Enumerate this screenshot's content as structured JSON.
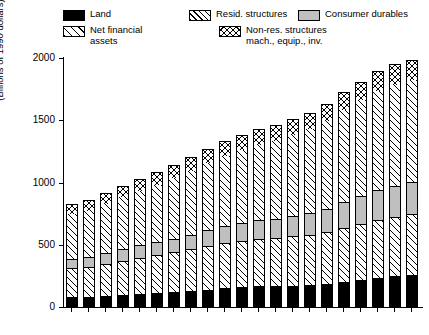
{
  "legend": {
    "items": [
      {
        "label": "Land",
        "swatch": "solid-black-swatch",
        "key": "land"
      },
      {
        "label": "Resid. structures",
        "swatch": "diagonal-hatch-swatch",
        "key": "resid"
      },
      {
        "label": "Consumer durables",
        "swatch": "solid-gray-swatch",
        "key": "durables"
      },
      {
        "label": "Net financial\nassets",
        "swatch": "diagonal-hatch-swatch",
        "key": "nfa"
      },
      {
        "label": "Non-res. structures\nmach., equip., inv.",
        "swatch": "crosshatch-swatch",
        "key": "nonres"
      }
    ]
  },
  "axes": {
    "ylabel": "(Billions of 1990 dollars)",
    "yticks": [
      0,
      500,
      1000,
      1500,
      2000
    ],
    "xticks": [
      "1970",
      "1972",
      "1974",
      "1976",
      "1978",
      "1980",
      "1982",
      "1984",
      "1986",
      "1988",
      "1990"
    ]
  },
  "colors": {
    "land": "#000000",
    "durables": "#bfbfbf",
    "background": "#ffffff",
    "axis": "#000000"
  },
  "chart_data": {
    "type": "bar",
    "title": "",
    "subtitle": "",
    "xlabel": "",
    "ylabel": "(Billions of 1990 dollars)",
    "ylim": [
      0,
      2000
    ],
    "yticks": [
      0,
      500,
      1000,
      1500,
      2000
    ],
    "grid": false,
    "stacked": true,
    "legend_position": "top",
    "categories": [
      "1970",
      "1971",
      "1972",
      "1973",
      "1974",
      "1975",
      "1976",
      "1977",
      "1978",
      "1979",
      "1980",
      "1981",
      "1982",
      "1983",
      "1984",
      "1985",
      "1986",
      "1987",
      "1988",
      "1989",
      "1990"
    ],
    "series": [
      {
        "name": "Land",
        "values": [
          80,
          82,
          88,
          96,
          104,
          112,
          120,
          128,
          140,
          152,
          160,
          168,
          168,
          172,
          176,
          184,
          200,
          216,
          232,
          248,
          256
        ]
      },
      {
        "name": "Resid. structures",
        "values": [
          232,
          240,
          258,
          276,
          292,
          306,
          318,
          334,
          350,
          362,
          372,
          380,
          388,
          396,
          404,
          418,
          436,
          452,
          468,
          478,
          488
        ]
      },
      {
        "name": "Consumer durables",
        "values": [
          76,
          80,
          88,
          96,
          100,
          104,
          112,
          120,
          128,
          136,
          142,
          148,
          152,
          160,
          172,
          188,
          204,
          220,
          236,
          248,
          256
        ]
      },
      {
        "name": "Net financial assets",
        "values": [
          368,
          380,
          400,
          424,
          444,
          468,
          492,
          520,
          548,
          572,
          596,
          616,
          636,
          660,
          684,
          712,
          748,
          780,
          808,
          820,
          828
        ]
      },
      {
        "name": "Non-res. structures mach., equip., inv.",
        "values": [
          72,
          74,
          78,
          82,
          88,
          92,
          96,
          100,
          104,
          108,
          112,
          116,
          118,
          122,
          126,
          130,
          136,
          142,
          148,
          154,
          160
        ]
      }
    ],
    "totals": [
      828,
      856,
      912,
      974,
      1028,
      1082,
      1138,
      1202,
      1270,
      1330,
      1382,
      1428,
      1462,
      1510,
      1562,
      1632,
      1724,
      1810,
      1892,
      1948,
      1988
    ]
  }
}
